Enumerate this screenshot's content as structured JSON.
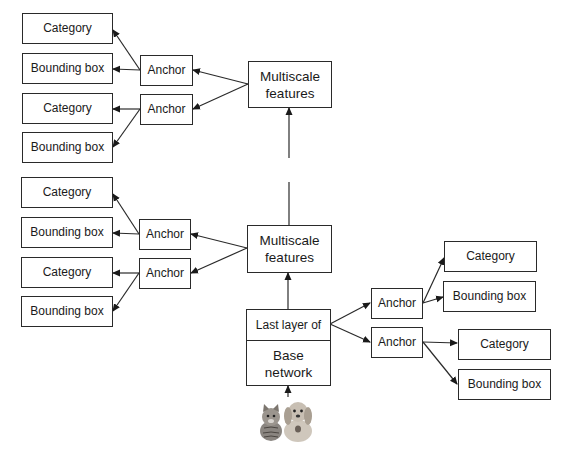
{
  "diagram": {
    "labels": {
      "category": "Category",
      "bounding_box": "Bounding box",
      "anchor": "Anchor",
      "multiscale_features": "Multiscale features",
      "last_layer_of": "Last layer of",
      "base_network": "Base network"
    },
    "top_group": {
      "multiscale": "Multiscale\nfeatures",
      "anchors": [
        {
          "label": "Anchor",
          "outputs": [
            "Category",
            "Bounding box"
          ]
        },
        {
          "label": "Anchor",
          "outputs": [
            "Category",
            "Bounding box"
          ]
        }
      ]
    },
    "middle_group": {
      "multiscale": "Multiscale\nfeatures",
      "anchors": [
        {
          "label": "Anchor",
          "outputs": [
            "Category",
            "Bounding box"
          ]
        },
        {
          "label": "Anchor",
          "outputs": [
            "Category",
            "Bounding box"
          ]
        }
      ]
    },
    "base": {
      "top_label": "Last layer of",
      "bottom_label": "Base\nnetwork",
      "anchors": [
        {
          "label": "Anchor",
          "outputs": [
            "Category",
            "Bounding box"
          ]
        },
        {
          "label": "Anchor",
          "outputs": [
            "Category",
            "Bounding box"
          ]
        }
      ]
    },
    "input_image": "cat-and-dog-image",
    "colors": {
      "line": "#2a2a2a",
      "background": "#ffffff"
    }
  }
}
